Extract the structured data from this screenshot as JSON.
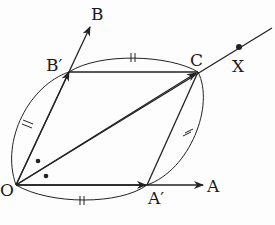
{
  "diagram": {
    "type": "geometry-rhombus-angle-bisector",
    "points": {
      "O": {
        "label": "O",
        "x": 16,
        "y": 185
      },
      "A_prime": {
        "label": "A′",
        "x": 147,
        "y": 185
      },
      "A": {
        "label": "A",
        "x": 203,
        "y": 185
      },
      "B_prime": {
        "label": "B′",
        "x": 69,
        "y": 72
      },
      "B": {
        "label": "B",
        "x": 90,
        "y": 27
      },
      "C": {
        "label": "C",
        "x": 198,
        "y": 72
      },
      "X": {
        "label": "X",
        "x": 239,
        "y": 47
      }
    },
    "segments": [
      "O-A",
      "O-B",
      "B′-C",
      "A′-C",
      "O-X (through C)"
    ],
    "equal_marks": "||",
    "angle_marks": "•",
    "colors": {
      "ink": "#222222",
      "background": "#fdfdfd"
    }
  }
}
